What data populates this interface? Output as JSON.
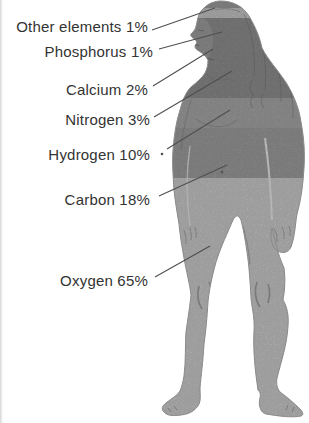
{
  "diagram": {
    "figure_alt": "shaded silhouette of a standing human body divided into gray horizontal bands",
    "labels": [
      {
        "element": "Other elements",
        "percent": "1%",
        "text": "Other elements 1%"
      },
      {
        "element": "Phosphorus",
        "percent": "1%",
        "text": "Phosphorus 1%"
      },
      {
        "element": "Calcium",
        "percent": "2%",
        "text": "Calcium 2%"
      },
      {
        "element": "Nitrogen",
        "percent": "3%",
        "text": "Nitrogen 3%"
      },
      {
        "element": "Hydrogen",
        "percent": "10%",
        "text": "Hydrogen 10%"
      },
      {
        "element": "Carbon",
        "percent": "18%",
        "text": "Carbon 18%"
      },
      {
        "element": "Oxygen",
        "percent": "65%",
        "text": "Oxygen 65%"
      }
    ],
    "colors": {
      "background": "#ffffff",
      "text": "#333333",
      "leader_line": "#4f4f4f",
      "outline": "#8a8a8a",
      "band_head_top": "#9a9a9a",
      "band_light_strip": "#c4c4c4",
      "band_upper_body": "#8e8e8e",
      "band_chest": "#a6a6a6",
      "band_abdomen": "#9d9d9d",
      "band_lower_body": "#c9c9c9"
    }
  }
}
